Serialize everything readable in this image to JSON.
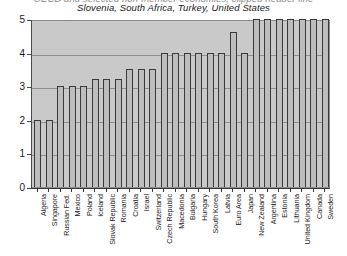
{
  "title": {
    "line1": "OECD and selected non-member economies, clipped header line",
    "line2": "Slovenia, South Africa, Turkey, United States"
  },
  "axes": {
    "y_ticks": [
      "0",
      "1",
      "2",
      "3",
      "4",
      "5"
    ],
    "y_min": 0,
    "y_max": 5
  },
  "chart_data": {
    "type": "bar",
    "title": "Slovenia, South Africa, Turkey, United States",
    "xlabel": "",
    "ylabel": "",
    "ylim": [
      0,
      5
    ],
    "grid": true,
    "legend": "none",
    "categories": [
      "Algeria",
      "Singapore",
      "Russian Fed.",
      "Mexico",
      "Poland",
      "Iceland",
      "Slovak Republic",
      "Romania",
      "Croatia",
      "Israel",
      "Switzerland",
      "Czech Republic",
      "Macedonia",
      "Bulgaria",
      "Hungary",
      "South Korea",
      "Latvia",
      "Euro Area",
      "Japan",
      "New Zealand",
      "Argentina",
      "Estonia",
      "Lithuania",
      "United Kingdom",
      "Canada",
      "Sweden"
    ],
    "values": [
      2.0,
      2.0,
      3.0,
      3.0,
      3.0,
      3.2,
      3.2,
      3.2,
      3.5,
      3.5,
      3.5,
      4.0,
      4.0,
      4.0,
      4.0,
      4.0,
      4.0,
      4.6,
      4.0,
      5.0,
      5.0,
      5.0,
      5.0,
      5.0,
      5.0,
      5.0
    ]
  }
}
